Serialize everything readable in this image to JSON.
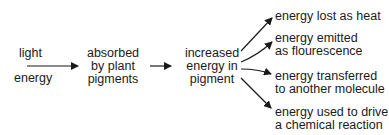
{
  "diagram": {
    "type": "flow",
    "input": {
      "line1": "light",
      "line2": "energy"
    },
    "step1": {
      "line1": "absorbed",
      "line2": "by plant",
      "line3": "pigments"
    },
    "step2": {
      "line1": "increased",
      "line2": "energy in",
      "line3": "pigment"
    },
    "outcomes": [
      {
        "line1": "energy lost as heat"
      },
      {
        "line1": "energy emitted",
        "line2": "as flourescence"
      },
      {
        "line1": "energy transferred",
        "line2": "to another molecule"
      },
      {
        "line1": "energy used to drive",
        "line2": "a chemical reaction"
      }
    ],
    "colors": {
      "ink": "#1a1a1a",
      "background": "#ffffff"
    }
  }
}
